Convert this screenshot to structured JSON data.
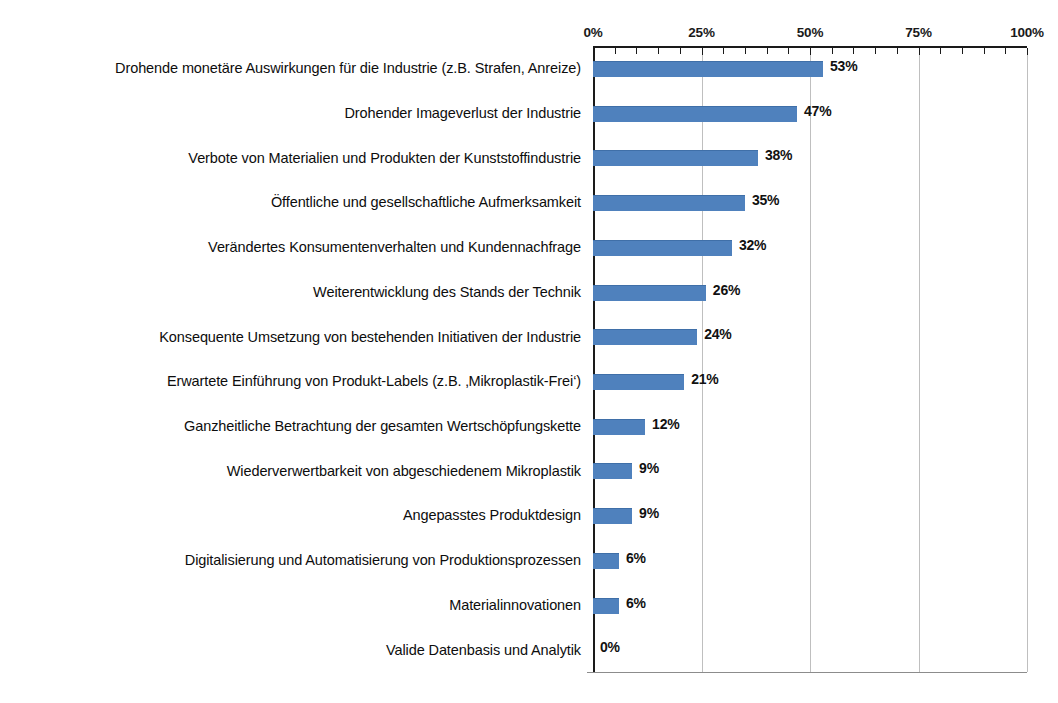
{
  "chart_data": {
    "type": "bar",
    "orientation": "horizontal",
    "title": "",
    "subtitle": "",
    "xlabel": "",
    "ylabel": "",
    "xlim": [
      0,
      100
    ],
    "grid": true,
    "legend": false,
    "legend_position": "none",
    "axis_tick_labels": [
      "0%",
      "25%",
      "50%",
      "75%",
      "100%"
    ],
    "axis_tick_values": [
      0,
      25,
      50,
      75,
      100
    ],
    "minor_tick_interval": 5,
    "value_suffix": "%",
    "bar_color": "#4f81bd",
    "gridline_color": "#bfbfbf",
    "axis_color": "#1a1a1a",
    "categories": [
      "Drohende monetäre Auswirkungen für die Industrie (z.B. Strafen, Anreize)",
      "Drohender Imageverlust der Industrie",
      "Verbote von Materialien und Produkten der Kunststoffindustrie",
      "Öffentliche und gesellschaftliche Aufmerksamkeit",
      "Verändertes Konsumentenverhalten und Kundennachfrage",
      "Weiterentwicklung des Stands der Technik",
      "Konsequente Umsetzung von bestehenden Initiativen der Industrie",
      "Erwartete Einführung von Produkt-Labels (z.B. ‚Mikroplastik-Frei‘)",
      "Ganzheitliche Betrachtung der gesamten Wertschöpfungskette",
      "Wiederverwertbarkeit von abgeschiedenem Mikroplastik",
      "Angepasstes Produktdesign",
      "Digitalisierung und Automatisierung von Produktionsprozessen",
      "Materialinnovationen",
      "Valide Datenbasis und Analytik"
    ],
    "values": [
      53,
      47,
      38,
      35,
      32,
      26,
      24,
      21,
      12,
      9,
      9,
      6,
      6,
      0
    ],
    "value_labels": [
      "53%",
      "47%",
      "38%",
      "35%",
      "32%",
      "26%",
      "24%",
      "21%",
      "12%",
      "9%",
      "9%",
      "6%",
      "6%",
      "0%"
    ]
  }
}
